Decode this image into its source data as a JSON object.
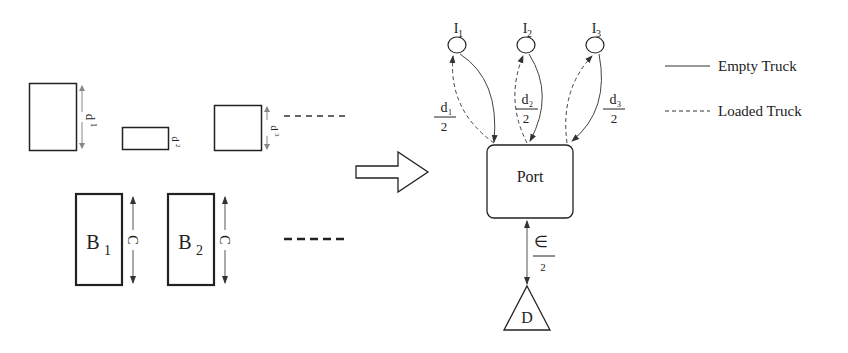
{
  "left_panel": {
    "top_row": [
      {
        "label": "d",
        "sub": "1"
      },
      {
        "label": "d",
        "sub": "2"
      },
      {
        "label": "d",
        "sub": "3"
      }
    ],
    "bottom_row": [
      {
        "label": "B",
        "sub": "1",
        "dim": "C"
      },
      {
        "label": "B",
        "sub": "2",
        "dim": "C"
      }
    ]
  },
  "right_panel": {
    "islands": [
      {
        "label": "I",
        "sub": "1",
        "frac_num": "d",
        "frac_num_sub": "1",
        "frac_den": "2"
      },
      {
        "label": "I",
        "sub": "2",
        "frac_num": "d",
        "frac_num_sub": "2",
        "frac_den": "2"
      },
      {
        "label": "I",
        "sub": "3",
        "frac_num": "d",
        "frac_num_sub": "3",
        "frac_den": "2"
      }
    ],
    "port_label": "Port",
    "depot_label": "D",
    "depot_frac_num": "∈",
    "depot_frac_den": "2"
  },
  "legend": {
    "items": [
      {
        "label": "Empty Truck",
        "style": "solid"
      },
      {
        "label": "Loaded Truck",
        "style": "dashed"
      }
    ]
  },
  "colors": {
    "stroke": "#222222",
    "arc": "#444444",
    "background": "#ffffff"
  }
}
